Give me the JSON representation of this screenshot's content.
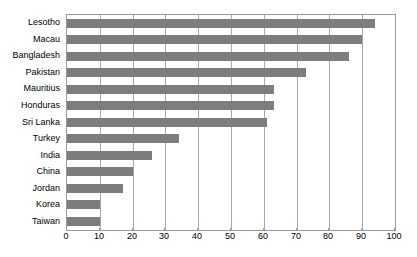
{
  "chart_data": {
    "type": "bar",
    "orientation": "horizontal",
    "title": "",
    "subtitle": "",
    "xlabel": "",
    "ylabel": "",
    "xlim": [
      0,
      100
    ],
    "xticks": [
      0,
      10,
      20,
      30,
      40,
      50,
      60,
      70,
      80,
      90,
      100
    ],
    "grid": true,
    "legend": false,
    "legend_position": "none",
    "bar_color": "#7d7d7d",
    "plot_border_color": "#9a9a9a",
    "gridline_color": "#a8a8a8",
    "background_color": "#ffffff",
    "categories": [
      "Lesotho",
      "Macau",
      "Bangladesh",
      "Pakistan",
      "Mauritius",
      "Honduras",
      "Sri Lanka",
      "Turkey",
      "India",
      "China",
      "Jordan",
      "Korea",
      "Taiwan"
    ],
    "values": [
      94,
      90,
      86,
      73,
      63,
      63,
      61,
      34,
      26,
      20,
      17,
      10,
      10
    ]
  }
}
